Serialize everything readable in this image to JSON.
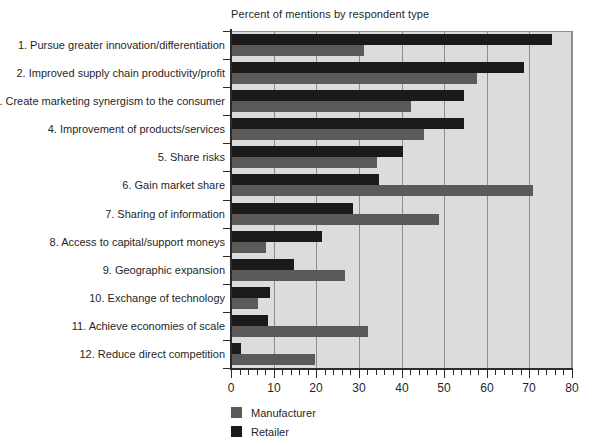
{
  "chart_data": {
    "type": "bar",
    "orientation": "horizontal",
    "title": "Percent of mentions by respondent type",
    "xlabel": "",
    "ylabel": "",
    "xlim": [
      0,
      80
    ],
    "xticks": [
      0,
      10,
      20,
      30,
      40,
      50,
      60,
      70,
      80
    ],
    "xtick_labels": [
      "0",
      "10",
      "20",
      "30",
      "40",
      "50",
      "60",
      "70",
      "80"
    ],
    "minor_tick_step": 2,
    "grid": true,
    "grid_axis": "x",
    "legend_position": "below-left",
    "categories": [
      "1. Pursue greater innovation/differentiation",
      "2. Improved supply chain productivity/profit",
      "3. Create marketing synergism to the consumer",
      "4. Improvement of products/services",
      "5. Share risks",
      "6. Gain market share",
      "7. Sharing of information",
      "8. Access to capital/support moneys",
      "9. Geographic expansion",
      "10. Exchange of technology",
      "11. Achieve economies of scale",
      "12. Reduce direct competition"
    ],
    "series": [
      {
        "name": "Retailer",
        "color": "#1a1a1a",
        "values": [
          75,
          68.5,
          54.5,
          54.5,
          40,
          34.5,
          28.5,
          21,
          14.5,
          9,
          8.5,
          2
        ]
      },
      {
        "name": "Manufacturer",
        "color": "#5a5a5a",
        "values": [
          31,
          57.5,
          42,
          45,
          34,
          70.5,
          48.5,
          8,
          26.5,
          6,
          32,
          19.5
        ]
      }
    ]
  },
  "legend": {
    "items": [
      {
        "label": "Manufacturer",
        "color": "#5a5a5a"
      },
      {
        "label": "Retailer",
        "color": "#1a1a1a"
      }
    ]
  },
  "colors": {
    "plot_background": "#dcdcdc",
    "gridline": "#8d8d8d",
    "axis": "#2b2b2b",
    "retailer": "#1a1a1a",
    "manufacturer": "#5a5a5a",
    "page_background": "#ffffff",
    "text": "#1f1f1f"
  }
}
